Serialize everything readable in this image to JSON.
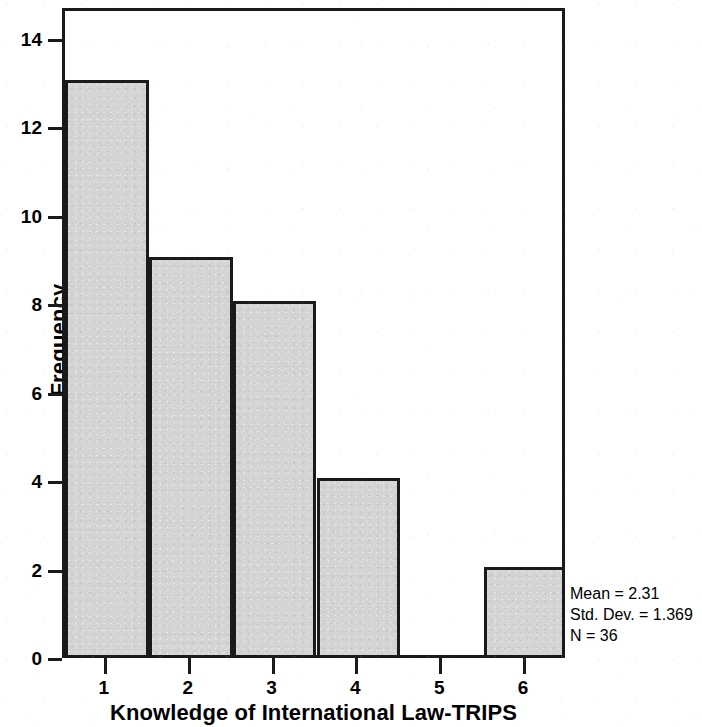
{
  "chart_data": {
    "type": "bar",
    "title": "",
    "subtitle": "",
    "xlabel": "Knowledge of International Law-TRIPS",
    "ylabel": "Frequency",
    "categories": [
      "1",
      "2",
      "3",
      "4",
      "5",
      "6"
    ],
    "values": [
      13,
      9,
      8,
      4,
      0,
      2
    ],
    "x": [
      1,
      2,
      3,
      4,
      5,
      6
    ],
    "bin_edges": [
      0.5,
      1.5,
      2.5,
      3.5,
      4.5,
      5.5,
      6.5
    ],
    "xlim": [
      0.5,
      6.5
    ],
    "ylim": [
      0,
      14.7
    ],
    "y_ticks": [
      0,
      2,
      4,
      6,
      8,
      10,
      12,
      14
    ],
    "x_ticks": [
      1,
      2,
      3,
      4,
      5,
      6
    ],
    "grid": false,
    "legend": false,
    "legend_position": "none",
    "bar_fill_color": "#d4d4d4",
    "bar_edge_color": "#1a1a1a",
    "annotations": [
      "Mean = 2.31",
      "Std. Dev. = 1.369",
      "N = 36"
    ]
  },
  "statistics": {
    "mean_label": "Mean = 2.31",
    "std_dev_label": "Std. Dev. = 1.369",
    "n_label": "N = 36"
  },
  "axes": {
    "y_title": "Frequency",
    "x_title": "Knowledge of International Law-TRIPS",
    "y_tick_labels": [
      "0",
      "2",
      "4",
      "6",
      "8",
      "10",
      "12",
      "14"
    ],
    "x_tick_labels": [
      "1",
      "2",
      "3",
      "4",
      "5",
      "6"
    ]
  }
}
